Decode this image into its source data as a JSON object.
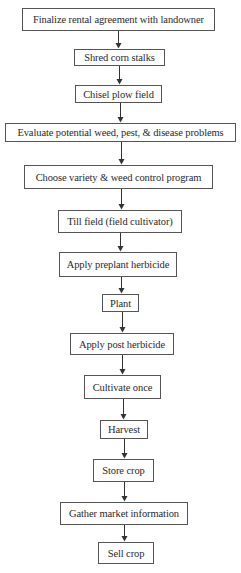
{
  "flowchart": {
    "line_color": "#333333",
    "steps": [
      {
        "id": "s1",
        "label": "Finalize rental agreement with landowner",
        "x": 22,
        "y": 8,
        "w": 193,
        "h": 23
      },
      {
        "id": "s2",
        "label": "Shred corn stalks",
        "x": 74,
        "y": 49,
        "w": 91,
        "h": 17
      },
      {
        "id": "s3",
        "label": "Chisel plow field",
        "x": 75,
        "y": 85,
        "w": 87,
        "h": 18
      },
      {
        "id": "s4",
        "label": "Evaluate potential weed, pest, & disease problems",
        "x": 5,
        "y": 123,
        "w": 231,
        "h": 19
      },
      {
        "id": "s5",
        "label": "Choose variety & weed control program",
        "x": 24,
        "y": 165,
        "w": 189,
        "h": 24
      },
      {
        "id": "s6",
        "label": "Till field (field cultivator)",
        "x": 58,
        "y": 210,
        "w": 124,
        "h": 23
      },
      {
        "id": "s7",
        "label": "Apply preplant herbicide",
        "x": 59,
        "y": 252,
        "w": 118,
        "h": 25
      },
      {
        "id": "s8",
        "label": "Plant",
        "x": 102,
        "y": 294,
        "w": 37,
        "h": 18
      },
      {
        "id": "s9",
        "label": "Apply post herbicide",
        "x": 70,
        "y": 333,
        "w": 104,
        "h": 22
      },
      {
        "id": "s10",
        "label": "Cultivate once",
        "x": 84,
        "y": 375,
        "w": 77,
        "h": 24
      },
      {
        "id": "s11",
        "label": "Harvest",
        "x": 100,
        "y": 420,
        "w": 48,
        "h": 19
      },
      {
        "id": "s12",
        "label": "Store crop",
        "x": 93,
        "y": 459,
        "w": 61,
        "h": 23
      },
      {
        "id": "s13",
        "label": "Gather market information",
        "x": 60,
        "y": 502,
        "w": 128,
        "h": 23
      },
      {
        "id": "s14",
        "label": "Sell crop",
        "x": 98,
        "y": 542,
        "w": 56,
        "h": 22
      }
    ],
    "arrows": [
      {
        "from": "s1",
        "to": "s2",
        "x": 118
      },
      {
        "from": "s2",
        "to": "s3",
        "x": 119
      },
      {
        "from": "s3",
        "to": "s4",
        "x": 120
      },
      {
        "from": "s4",
        "to": "s5",
        "x": 121
      },
      {
        "from": "s5",
        "to": "s6",
        "x": 121
      },
      {
        "from": "s6",
        "to": "s7",
        "x": 120
      },
      {
        "from": "s7",
        "to": "s8",
        "x": 121
      },
      {
        "from": "s8",
        "to": "s9",
        "x": 122
      },
      {
        "from": "s9",
        "to": "s10",
        "x": 122
      },
      {
        "from": "s10",
        "to": "s11",
        "x": 123
      },
      {
        "from": "s11",
        "to": "s12",
        "x": 124
      },
      {
        "from": "s12",
        "to": "s13",
        "x": 124
      },
      {
        "from": "s13",
        "to": "s14",
        "x": 124
      }
    ]
  }
}
